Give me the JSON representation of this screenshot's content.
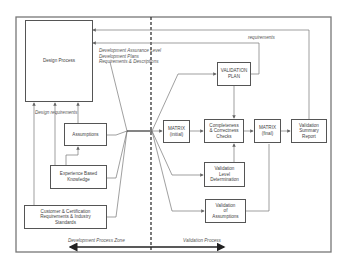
{
  "diagram": {
    "boxes": {
      "design_process": "Design Process",
      "assumptions": "Assumptions",
      "experience": "Experience Based\nKnowledge",
      "customer": "Customer & Certification\nRequirements & Industry\nStandards",
      "validation_plan": "VALIDATION\nPLAN",
      "matrix_initial": "MATRIX\n(initial)",
      "completeness": "Completeness\n& Correctness\nChecks",
      "matrix_final": "MATRIX\n(final)",
      "summary": "Validation\nSummary\nReport",
      "level_determination": "Validation\nLevel\nDetermination",
      "validation_assumptions": "Validation\nof\nAssumptions"
    },
    "labels": {
      "dev_outputs": "Development Assurance Level\nDevelopment Plans\nRequirements & Descriptions",
      "design_requirements": "Design requirements",
      "requirements": "requirements",
      "dev_zone": "Development Process Zone",
      "validation_zone": "Validation Process"
    },
    "colors": {
      "line": "#666666",
      "box_border": "#555555",
      "text": "#444444"
    }
  }
}
